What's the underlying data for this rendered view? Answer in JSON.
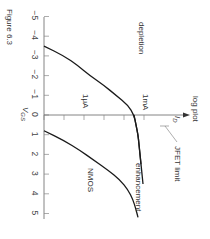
{
  "chart_data": {
    "type": "line",
    "title": "Figure 6.3",
    "orientation": "rotated 90 degrees clockwise",
    "xlabel": "V_GS",
    "ylabel": "I_D",
    "ylabel_note": "log plot",
    "x_ticks": [
      "-5",
      "-4",
      "-3",
      "-2",
      "-1",
      "0",
      "1",
      "2",
      "3",
      "4",
      "5"
    ],
    "xlim": [
      -5,
      5
    ],
    "y_tick_labels": [
      {
        "label": "1μA",
        "decade": 1
      },
      {
        "label": "1mA",
        "decade": 4
      }
    ],
    "y_scale": "log",
    "y_decades_shown": 5,
    "series": [
      {
        "name": "depletion",
        "x": [
          -3.5,
          -3.0,
          -2.5,
          -2.0,
          -1.5,
          -1.0,
          -0.5,
          0.0,
          0.5,
          1.0,
          1.5,
          2.0,
          2.5
        ],
        "log_decades": [
          0.0,
          1.0,
          1.7,
          2.3,
          3.0,
          3.6,
          4.2,
          4.5,
          4.6,
          4.7,
          4.75,
          4.8,
          4.85
        ]
      },
      {
        "name": "enhancement",
        "x": [
          0.8,
          1.3,
          1.8,
          2.3,
          2.8,
          3.3,
          3.8,
          4.3,
          4.8,
          5.2
        ],
        "log_decades": [
          0.0,
          1.0,
          1.8,
          2.5,
          3.2,
          3.8,
          4.2,
          4.45,
          4.6,
          4.7
        ]
      },
      {
        "name": "JFET limit",
        "x": [
          0.0,
          0.5,
          1.0,
          1.5,
          2.0,
          2.5,
          3.0,
          3.5
        ],
        "log_decades": [
          4.5,
          4.6,
          4.7,
          4.75,
          4.8,
          4.85,
          4.9,
          4.95
        ]
      }
    ],
    "annotations": [
      "depletion",
      "enhancement",
      "NMOS",
      "JFET limit",
      "1μA",
      "1mA",
      "log plot",
      "I_D",
      "V_GS"
    ]
  },
  "labels": {
    "figure": "Figure 6.3",
    "vgs": "V",
    "vgs_sub": "GS",
    "id": "I",
    "id_sub": "D",
    "log_plot": "log plot",
    "depletion": "depletion",
    "enhancement": "enhancement",
    "nmos": "NMOS",
    "jfet_limit": "JFET limit",
    "ua": "1μA",
    "ma": "1mA"
  }
}
